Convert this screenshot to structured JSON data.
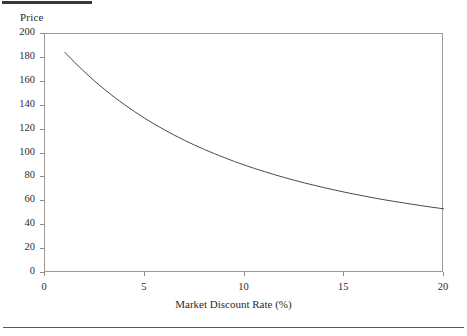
{
  "figure": {
    "top_rule": "thick-rule",
    "bottom_rule": "thin-rule"
  },
  "chart_data": {
    "type": "line",
    "title": "",
    "xlabel": "Market Discount Rate (%)",
    "ylabel": "Price",
    "xlim": [
      0,
      20
    ],
    "ylim": [
      0,
      200
    ],
    "grid": false,
    "legend": null,
    "xticks": [
      0,
      5,
      10,
      15,
      20
    ],
    "xtick_labels": [
      "0",
      "5",
      "10",
      "15",
      "20"
    ],
    "yticks": [
      0,
      20,
      40,
      60,
      80,
      100,
      120,
      140,
      160,
      180,
      200
    ],
    "ytick_labels": [
      "0",
      "20",
      "40",
      "60",
      "80",
      "100",
      "120",
      "140",
      "160",
      "180",
      "200"
    ],
    "line_color": "#4a4a4a",
    "line_width": 1,
    "series": [
      {
        "name": "Price",
        "x": [
          1,
          1.5,
          2,
          2.5,
          3,
          3.5,
          4,
          4.5,
          5,
          5.5,
          6,
          6.5,
          7,
          7.5,
          8,
          8.5,
          9,
          9.5,
          10,
          10.5,
          11,
          11.5,
          12,
          12.5,
          13,
          13.5,
          14,
          14.5,
          15,
          15.5,
          16,
          16.5,
          17,
          17.5,
          18,
          18.5,
          19,
          19.5,
          20
        ],
        "values": [
          184.6,
          176.0,
          168.0,
          160.4,
          153.4,
          146.8,
          140.7,
          134.9,
          129.5,
          124.4,
          119.7,
          115.2,
          111.0,
          107.0,
          103.3,
          99.8,
          96.5,
          93.3,
          90.3,
          87.5,
          84.9,
          82.3,
          79.9,
          77.6,
          75.4,
          73.4,
          71.4,
          69.5,
          67.7,
          66.0,
          64.4,
          62.8,
          61.3,
          59.9,
          58.6,
          57.3,
          56.0,
          54.8,
          53.7
        ]
      }
    ]
  }
}
